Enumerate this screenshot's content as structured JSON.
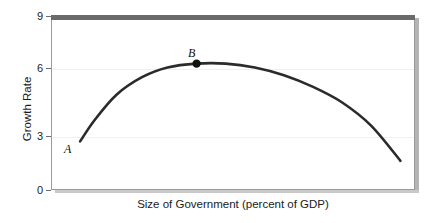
{
  "chart_data": {
    "type": "line",
    "title": "",
    "subtitle": "",
    "xlabel": "Size of Government (percent of GDP)",
    "ylabel": "Growth Rate",
    "xlim": [
      0,
      100
    ],
    "ylim": [
      0,
      9
    ],
    "grid": true,
    "legend_position": "none",
    "y_ticks": [
      {
        "value": 9,
        "label": "9"
      },
      {
        "value": 6,
        "label": "6"
      },
      {
        "value": 3,
        "label": "3"
      },
      {
        "value": 0,
        "label": "0"
      }
    ],
    "x_ticks": [],
    "series": [
      {
        "name": "Growth Rate curve",
        "shape": "inverted-u",
        "x": [
          8,
          12,
          18,
          25,
          32,
          40,
          48,
          56,
          64,
          72,
          80,
          88,
          96
        ],
        "y": [
          2.5,
          3.6,
          4.9,
          5.8,
          6.3,
          6.5,
          6.5,
          6.3,
          5.9,
          5.3,
          4.5,
          3.3,
          1.5
        ]
      }
    ],
    "annotations": [
      {
        "name": "A",
        "label": "A",
        "x": 8,
        "y": 2.5,
        "marker": false,
        "description": "label at left start of curve"
      },
      {
        "name": "B",
        "label": "B",
        "x": 40,
        "y": 6.5,
        "marker": true,
        "description": "filled dot at peak of curve"
      }
    ],
    "colors": {
      "curve": "#2b2b2b",
      "marker": "#111111",
      "gridline": "#f0f0f0",
      "axis": "#9a9a9a",
      "top_rule": "#6a6a6a",
      "shadow": "#b4b4b4",
      "background": "#ffffff",
      "text": "#1a1a1a"
    }
  }
}
